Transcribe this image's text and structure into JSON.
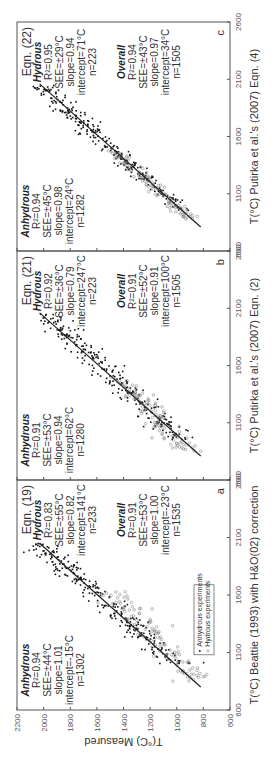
{
  "chart_data": [
    {
      "type": "scatter",
      "panel": "a",
      "equation_label": "Eqn. (19)",
      "xlabel": "T(°C) Beattie (1993) with H&O(02) correction",
      "ylabel": "T(°C) Measured",
      "xlim": [
        600,
        2600
      ],
      "ylim": [
        600,
        2200
      ],
      "xticks": [
        "600",
        "1100",
        "1600",
        "2100",
        "2600"
      ],
      "yticks": [
        "600",
        "800",
        "1000",
        "1200",
        "1400",
        "1600",
        "1800",
        "2000",
        "2200"
      ],
      "legend": {
        "position": "bottom-right",
        "entries": [
          "Anhydrous experiments",
          "Hydrous experiments"
        ]
      },
      "fit_line": {
        "x": [
          800,
          2050
        ],
        "y": [
          820,
          2030
        ]
      },
      "stats": {
        "anhydrous": {
          "title": "Anhydrous",
          "r2": "R²=0.94",
          "see": "SEE=±44°C",
          "slope": "slope=1.01",
          "intercept": "intercept=-15°C",
          "n": "n=1302"
        },
        "hydrous": {
          "title": "Hydrous",
          "r2": "R²=0.83",
          "see": "SEE=±55°C",
          "slope": "slope=0.82",
          "intercept": "intercept=141°C",
          "n": "n=233"
        },
        "overall": {
          "title": "Overall",
          "r2": "R²=0.91",
          "see": "SEE=±53°C",
          "slope": "slope=1.00",
          "intercept": "intercept=-23°C",
          "n": "n=1535"
        }
      },
      "series": [
        {
          "name": "Anhydrous experiments",
          "marker": "dot",
          "cloud": {
            "x_range": [
              1000,
              2050
            ],
            "slope": 1.01,
            "intercept": -15,
            "spread": 60,
            "count": 260
          }
        },
        {
          "name": "Hydrous experiments",
          "marker": "circle",
          "cloud": {
            "x_range": [
              850,
              1650
            ],
            "slope": 0.82,
            "intercept": 141,
            "spread": 70,
            "count": 120
          }
        }
      ]
    },
    {
      "type": "scatter",
      "panel": "b",
      "equation_label": "Eqn. (21)",
      "xlabel": "T(°C) Putirka et al.'s (2007) Eqn. (2)",
      "ylabel": "T(°C) Measured",
      "xlim": [
        600,
        2600
      ],
      "ylim": [
        600,
        2200
      ],
      "xticks": [
        "600",
        "1100",
        "1600",
        "2100",
        "2600"
      ],
      "yticks": [
        "600",
        "800",
        "1000",
        "1200",
        "1400",
        "1600",
        "1800",
        "2000",
        "2200"
      ],
      "fit_line": {
        "x": [
          810,
          2060
        ],
        "y": [
          820,
          2030
        ]
      },
      "stats": {
        "anhydrous": {
          "title": "Anhydrous",
          "r2": "R²=0.91",
          "see": "SEE=±53°C",
          "slope": "slope=0.94",
          "intercept": "intercept=62°C",
          "n": "n=1280"
        },
        "hydrous": {
          "title": "Hydrous",
          "r2": "R²=0.92",
          "see": "SEE=±36°C",
          "slope": "slope=0.79",
          "intercept": "intercept=247°C",
          "n": "n=223"
        },
        "overall": {
          "title": "Overall",
          "r2": "R²=0.91",
          "see": "SEE=±52°C",
          "slope": "slope=0.91",
          "intercept": "intercept=100°C",
          "n": "n=1505"
        }
      },
      "series": [
        {
          "name": "Anhydrous experiments",
          "marker": "dot",
          "cloud": {
            "x_range": [
              950,
              2050
            ],
            "slope": 0.94,
            "intercept": 62,
            "spread": 60,
            "count": 260
          }
        },
        {
          "name": "Hydrous experiments",
          "marker": "circle",
          "cloud": {
            "x_range": [
              850,
              1500
            ],
            "slope": 0.79,
            "intercept": 247,
            "spread": 55,
            "count": 110
          }
        }
      ]
    },
    {
      "type": "scatter",
      "panel": "c",
      "equation_label": "Eqn. (22)",
      "xlabel": "T(°C) Putirka et al.'s (2007) Eqn. (4)",
      "ylabel": "T(°C) Measured",
      "xlim": [
        600,
        2600
      ],
      "ylim": [
        600,
        2200
      ],
      "xticks": [
        "600",
        "1100",
        "1600",
        "2100",
        "2600"
      ],
      "yticks": [
        "600",
        "800",
        "1000",
        "1200",
        "1400",
        "1600",
        "1800",
        "2000",
        "2200"
      ],
      "fit_line": {
        "x": [
          810,
          2060
        ],
        "y": [
          820,
          2030
        ]
      },
      "stats": {
        "anhydrous": {
          "title": "Anhydrous",
          "r2": "R²=0.94",
          "see": "SEE=±45°C",
          "slope": "slope=0.98",
          "intercept": "intercept=24°C",
          "n": "n=1282"
        },
        "hydrous": {
          "title": "Hydrous",
          "r2": "R²=0.95",
          "see": "SEE=±29°C",
          "slope": "slope=0.94",
          "intercept": "intercept=71°C",
          "n": "n=223"
        },
        "overall": {
          "title": "Overall",
          "r2": "R²=0.94",
          "see": "SEE=±43°C",
          "slope": "slope=0.97",
          "intercept": "intercept=34°C",
          "n": "n=1505"
        }
      },
      "series": [
        {
          "name": "Anhydrous experiments",
          "marker": "dot",
          "cloud": {
            "x_range": [
              950,
              2050
            ],
            "slope": 0.98,
            "intercept": 24,
            "spread": 50,
            "count": 260
          }
        },
        {
          "name": "Hydrous experiments",
          "marker": "circle",
          "cloud": {
            "x_range": [
              880,
              1500
            ],
            "slope": 0.94,
            "intercept": 71,
            "spread": 40,
            "count": 110
          }
        }
      ]
    }
  ],
  "shared": {
    "ylabel": "T(°C) Measured"
  }
}
